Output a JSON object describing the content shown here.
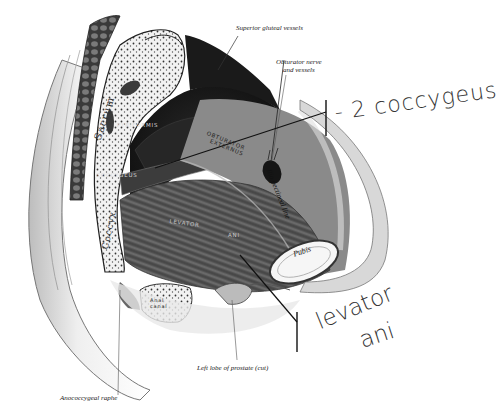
{
  "figure": {
    "type": "anatomical-illustration",
    "view": "sagittal section of male pelvis, left half, interior view of pelvic floor"
  },
  "printed_labels": {
    "superior_gluteal": "Superior gluteal vessels",
    "obturator_line1": "Obturator nerve",
    "obturator_line2": "and vessels",
    "iliopectineal": "Ilio pectineal line",
    "prostate": "Left lobe of prostate (cut)",
    "anococcygeal": "Anococcygeal raphe"
  },
  "structure_labels": {
    "sacrum": "Sacrum",
    "coccyx": "Coccyx",
    "pyriformis": "PYRIFORMIS",
    "coccygeus": "COCCYGEUS",
    "obturator_internus_1": "OBTURATOR",
    "obturator_internus_2": "EXTERNUS",
    "levator": "LEVATOR",
    "ani": "ANI",
    "pubis": "Pubis",
    "anal_canal_1": "Anal",
    "anal_canal_2": "canal"
  },
  "handwritten_labels": {
    "coccygeus": "- 2 coccygeus",
    "levator_line1": "levator",
    "levator_line2": "ani"
  }
}
